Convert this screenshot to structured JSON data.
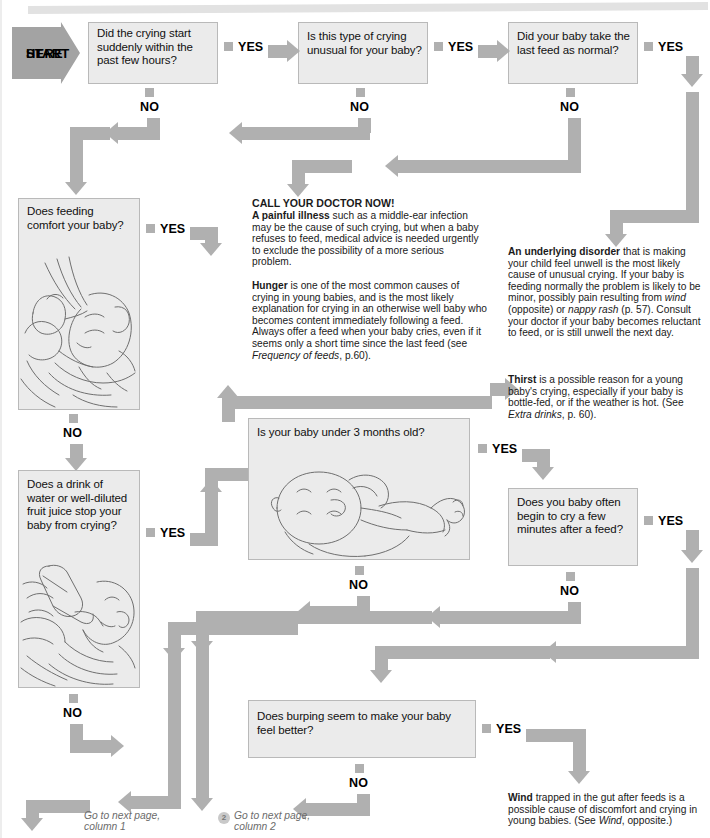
{
  "start": {
    "line1": "START",
    "line2": "HERE"
  },
  "labels": {
    "yes": "YES",
    "no": "NO"
  },
  "questions": {
    "q1": "Did the crying start suddenly within the past few hours?",
    "q2": "Is this type of crying unusual for your baby?",
    "q3": "Did your baby take the last feed as normal?",
    "q4": "Does feeding comfort your baby?",
    "q5": "Does a drink of water or well-diluted fruit juice stop your baby from crying?",
    "q6": "Is your baby under 3 months old?",
    "q7": "Does you baby often begin to cry a few minutes after a feed?",
    "q8": "Does burping seem to make your baby feel better?"
  },
  "prose": {
    "doctor_heading": "CALL YOUR DOCTOR NOW!",
    "painful_illness_lead": "A painful illness",
    "painful_illness_body": " such as a middle-ear infection may be the cause of such crying, but when a baby refuses to feed, medical advice is needed urgently to exclude the possibility of a more serious problem.",
    "hunger_lead": "Hunger",
    "hunger_body_1": " is one of the most common causes of crying in young babies, and is the most likely explanation for crying in an otherwise well baby who becomes content immediately following a feed. Always offer a feed when your baby cries, even if it seems only a short time since the last feed (see ",
    "hunger_italic": "Frequency of feeds",
    "hunger_body_2": ", p.60).",
    "disorder_lead": "An underlying disorder",
    "disorder_body_1": " that is making your child feel unwell is the most likely cause of unusual crying. If your baby is feeding normally the problem is likely to be minor, possibly pain resulting from ",
    "disorder_italic_1": "wind",
    "disorder_body_2": " (opposite) or ",
    "disorder_italic_2": "nappy rash",
    "disorder_body_3": " (p. 57). Consult your doctor if your baby becomes reluctant to feed, or is still unwell the next day.",
    "thirst_lead": "Thirst",
    "thirst_body_1": " is a possible reason for a young baby's crying, especially if your baby is bottle-fed, or if the weather is hot. (See ",
    "thirst_italic": "Extra drinks",
    "thirst_body_2": ", p. 60).",
    "wind_lead": "Wind",
    "wind_body_1": " trapped in the gut after feeds is a possible cause of discomfort and crying in young babies. (See ",
    "wind_italic": "Wind",
    "wind_body_2": ", opposite.)"
  },
  "footer": {
    "col1_line1": "Go to next page,",
    "col1_line2": "column 1",
    "col2_line1": "Go to next page,",
    "col2_line2": "column 2",
    "col2_marker": "2"
  },
  "illustrations": {
    "breastfeeding": "breastfeeding-illustration",
    "bottlefeeding": "bottle-feeding-illustration",
    "lying_baby": "lying-baby-illustration"
  },
  "colors": {
    "arrow": "#b0b0b0",
    "start_arrow": "#a3a3a3",
    "box_fill": "#ebebeb",
    "box_border": "#b9b9b9"
  }
}
